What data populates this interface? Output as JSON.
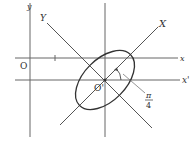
{
  "diagram": {
    "labels": {
      "y_axis": "y",
      "x_axis": "x",
      "origin": "O",
      "new_origin": "O'",
      "rotated_x": "X",
      "rotated_y": "Y",
      "translated_x": "x'",
      "angle_numerator": "π",
      "angle_denominator": "4"
    },
    "colors": {
      "line": "#555555",
      "ellipse": "#333333",
      "text": "#333333"
    }
  }
}
